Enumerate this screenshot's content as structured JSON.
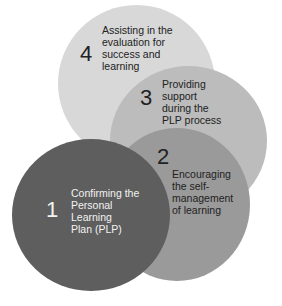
{
  "diagram": {
    "type": "overlapping-circles-cycle",
    "steps": [
      {
        "number": "1",
        "label": "Confirming the\nPersonal\nLearning\nPlan (PLP)",
        "color": "#5e5e5e"
      },
      {
        "number": "2",
        "label": "Encouraging\nthe self-\nmanagement\nof learning",
        "color": "#9a9a9a"
      },
      {
        "number": "3",
        "label": "Providing\nsupport\nduring the\nPLP process",
        "color": "#bcbcbc"
      },
      {
        "number": "4",
        "label": "Assisting in the\nevaluation for\nsuccess and\nlearning",
        "color": "#d8d8d8"
      }
    ]
  }
}
